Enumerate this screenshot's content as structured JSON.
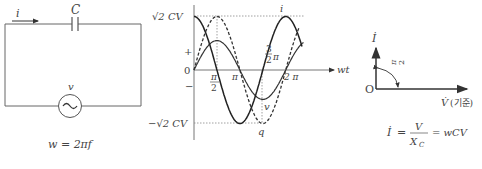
{
  "circuit": {
    "current_label": "i",
    "capacitor_label": "C",
    "source_label": "v",
    "formula": "w = 2πf"
  },
  "waveform": {
    "y_max_label": "√2 CV",
    "y_min_label": "−√2 CV",
    "plus_label": "+",
    "zero_label": "0",
    "minus_label": "−",
    "x_axis_label": "wt",
    "tick_half_pi": {
      "num": "π",
      "den": "2"
    },
    "tick_pi": "π",
    "tick_three_half_pi": {
      "num": "3",
      "den": "2",
      "suffix": "π"
    },
    "tick_two_pi": "2 π",
    "curve_i_label": "i",
    "curve_v_label": "v",
    "curve_q_label": "q",
    "chart_data": {
      "type": "line",
      "x_unit": "rad",
      "x_range": [
        0,
        7.4
      ],
      "series": [
        {
          "name": "i",
          "style": "solid",
          "amplitude": 1.0,
          "phase": 1.5708
        },
        {
          "name": "v",
          "style": "solid",
          "amplitude": 0.55,
          "phase": 0
        },
        {
          "name": "q",
          "style": "dashed",
          "amplitude": 1.0,
          "phase": 0
        }
      ]
    }
  },
  "phasor": {
    "origin_label": "O",
    "current_label": "İ",
    "angle_label": {
      "num": "π",
      "den": "2"
    },
    "voltage_label": "V̇",
    "voltage_note": "(기준)",
    "formula_lhs": "İ",
    "formula_num": "V",
    "formula_den": "X",
    "formula_den_sub": "C",
    "formula_rhs": "= wCV"
  },
  "colors": {
    "line": "#333333",
    "dotted": "#777777",
    "text": "#444444"
  }
}
